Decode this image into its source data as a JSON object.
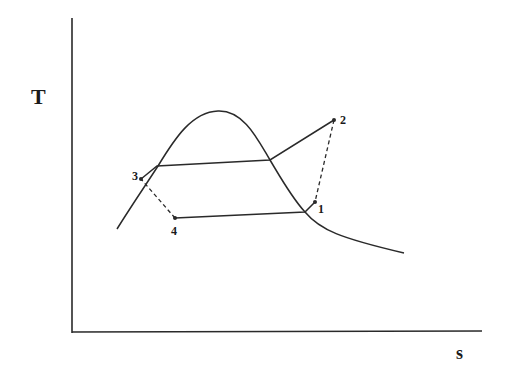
{
  "diagram": {
    "type": "T-s diagram",
    "axes": {
      "y_label": "T",
      "x_label": "s"
    },
    "points": [
      {
        "id": "1",
        "label": "1"
      },
      {
        "id": "2",
        "label": "2"
      },
      {
        "id": "3",
        "label": "3"
      },
      {
        "id": "4",
        "label": "4"
      }
    ],
    "colors": {
      "line": "#2a2a2a",
      "background": "#ffffff"
    }
  }
}
